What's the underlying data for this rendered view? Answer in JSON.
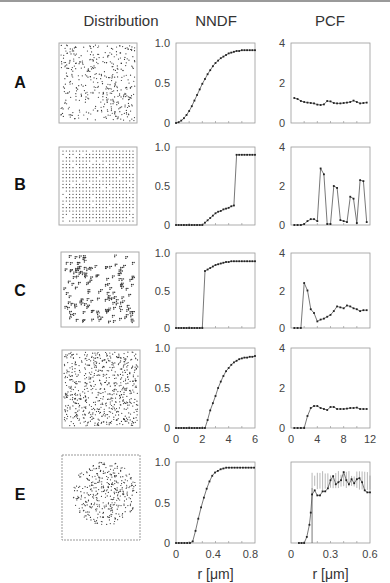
{
  "headers": {
    "distribution": "Distribution",
    "nndf": "NNDF",
    "pcf": "PCF"
  },
  "row_labels": [
    "A",
    "B",
    "C",
    "D",
    "E"
  ],
  "x_axis_label": "r [μm]",
  "colors": {
    "frame": "#9a9a9a",
    "series": "#333333",
    "marker": "#222222",
    "errorbar": "#888888"
  },
  "chart_data": [
    {
      "type": "line",
      "panel": "A-NNDF",
      "title": "NNDF",
      "xlim": [
        0,
        6
      ],
      "ylim": [
        0,
        1.0
      ],
      "yticks": [
        "0",
        "0.5",
        "1.0"
      ],
      "xticks": [],
      "x": [
        0,
        0.2,
        0.4,
        0.6,
        0.8,
        1.0,
        1.2,
        1.4,
        1.6,
        1.8,
        2.0,
        2.2,
        2.4,
        2.6,
        2.8,
        3.0,
        3.2,
        3.4,
        3.6,
        3.8,
        4.0,
        4.2,
        4.4,
        4.6,
        4.8,
        5.0,
        5.2,
        5.4,
        5.6,
        5.8,
        6.0
      ],
      "y": [
        0,
        0.01,
        0.03,
        0.06,
        0.1,
        0.15,
        0.21,
        0.28,
        0.35,
        0.42,
        0.49,
        0.55,
        0.61,
        0.66,
        0.71,
        0.75,
        0.78,
        0.81,
        0.83,
        0.85,
        0.87,
        0.88,
        0.89,
        0.9,
        0.9,
        0.91,
        0.91,
        0.91,
        0.91,
        0.91,
        0.91
      ]
    },
    {
      "type": "line",
      "panel": "A-PCF",
      "title": "PCF",
      "xlim": [
        0,
        12
      ],
      "ylim": [
        0,
        4
      ],
      "yticks": [
        "0",
        "2",
        "4"
      ],
      "xticks": [],
      "x": [
        0.5,
        1,
        1.5,
        2,
        2.5,
        3,
        3.5,
        4,
        4.5,
        5,
        5.5,
        6,
        6.5,
        7,
        7.5,
        8,
        8.5,
        9,
        9.5,
        10,
        10.5,
        11,
        11.5
      ],
      "y": [
        1.25,
        1.2,
        1.1,
        1.05,
        1.02,
        1.0,
        0.98,
        0.92,
        0.9,
        0.93,
        1.1,
        1.08,
        1.0,
        0.98,
        0.98,
        1.0,
        1.02,
        1.05,
        1.12,
        1.05,
        0.98,
        1.0,
        1.02
      ]
    },
    {
      "type": "line",
      "panel": "B-NNDF",
      "xlim": [
        0,
        6
      ],
      "ylim": [
        0,
        1.0
      ],
      "yticks": [
        "0",
        "0.5",
        "1.0"
      ],
      "xticks": [],
      "x": [
        0,
        0.2,
        0.4,
        0.6,
        0.8,
        1.0,
        1.2,
        1.4,
        1.6,
        1.8,
        2.0,
        2.2,
        2.4,
        2.6,
        2.8,
        3.0,
        3.2,
        3.4,
        3.6,
        3.8,
        4.0,
        4.2,
        4.4,
        4.6,
        4.8,
        5.0,
        5.2,
        5.4,
        5.6,
        5.8,
        6.0
      ],
      "y": [
        0,
        0,
        0,
        0,
        0,
        0,
        0,
        0,
        0,
        0,
        0,
        0.03,
        0.06,
        0.09,
        0.12,
        0.15,
        0.17,
        0.18,
        0.2,
        0.21,
        0.22,
        0.24,
        0.25,
        0.9,
        0.9,
        0.9,
        0.9,
        0.9,
        0.9,
        0.9,
        0.9
      ]
    },
    {
      "type": "line",
      "panel": "B-PCF",
      "xlim": [
        0,
        12
      ],
      "ylim": [
        0,
        4
      ],
      "yticks": [
        "0",
        "2",
        "4"
      ],
      "xticks": [],
      "x": [
        0.5,
        1,
        1.5,
        2,
        2.5,
        3,
        3.5,
        4,
        4.5,
        5,
        5.5,
        6,
        6.5,
        7,
        7.5,
        8,
        8.5,
        9,
        9.5,
        10,
        10.5,
        11,
        11.5
      ],
      "y": [
        0,
        0,
        0,
        0.05,
        0.2,
        0.3,
        0.3,
        0.2,
        2.9,
        2.6,
        0.05,
        0.05,
        2.0,
        1.9,
        0.25,
        0.2,
        0.15,
        1.45,
        1.35,
        0.1,
        2.3,
        2.25,
        0.15
      ]
    },
    {
      "type": "line",
      "panel": "C-NNDF",
      "xlim": [
        0,
        6
      ],
      "ylim": [
        0,
        1.0
      ],
      "yticks": [
        "0",
        "0.5",
        "1.0"
      ],
      "xticks": [],
      "x": [
        0,
        0.2,
        0.4,
        0.6,
        0.8,
        1.0,
        1.2,
        1.4,
        1.6,
        1.8,
        2.0,
        2.2,
        2.4,
        2.6,
        2.8,
        3.0,
        3.2,
        3.4,
        3.6,
        3.8,
        4.0,
        4.2,
        4.4,
        4.6,
        4.8,
        5.0,
        5.2,
        5.4,
        5.6,
        5.8,
        6.0
      ],
      "y": [
        0,
        0,
        0,
        0,
        0,
        0,
        0,
        0,
        0,
        0,
        0,
        0.76,
        0.78,
        0.8,
        0.82,
        0.84,
        0.85,
        0.86,
        0.87,
        0.88,
        0.88,
        0.89,
        0.89,
        0.89,
        0.89,
        0.89,
        0.89,
        0.89,
        0.89,
        0.89,
        0.89
      ]
    },
    {
      "type": "line",
      "panel": "C-PCF",
      "xlim": [
        0,
        12
      ],
      "ylim": [
        0,
        4
      ],
      "yticks": [
        "0",
        "2",
        "4"
      ],
      "xticks": [],
      "x": [
        0.5,
        1,
        1.5,
        2,
        2.5,
        3,
        3.5,
        4,
        4.5,
        5,
        5.5,
        6,
        6.5,
        7,
        7.5,
        8,
        8.5,
        9,
        9.5,
        10,
        10.5,
        11,
        11.5
      ],
      "y": [
        0,
        0,
        0,
        2.4,
        2.0,
        1.0,
        0.8,
        0.35,
        0.45,
        0.5,
        0.6,
        0.7,
        0.9,
        1.15,
        1.1,
        1.05,
        1.2,
        1.15,
        1.05,
        1.0,
        0.9,
        0.95,
        0.95
      ]
    },
    {
      "type": "line",
      "panel": "D-NNDF",
      "xlim": [
        0,
        6
      ],
      "ylim": [
        0,
        1.0
      ],
      "yticks": [
        "0",
        "0.5",
        "1.0"
      ],
      "xticks": [
        "0",
        "2",
        "4",
        "6"
      ],
      "x": [
        0,
        0.2,
        0.4,
        0.6,
        0.8,
        1.0,
        1.2,
        1.4,
        1.6,
        1.8,
        2.0,
        2.2,
        2.4,
        2.6,
        2.8,
        3.0,
        3.2,
        3.4,
        3.6,
        3.8,
        4.0,
        4.2,
        4.4,
        4.6,
        4.8,
        5.0,
        5.2,
        5.4,
        5.6,
        5.8,
        6.0
      ],
      "y": [
        0,
        0,
        0,
        0,
        0,
        0,
        0,
        0,
        0,
        0,
        0,
        0,
        0.1,
        0.22,
        0.31,
        0.4,
        0.5,
        0.58,
        0.65,
        0.71,
        0.75,
        0.79,
        0.82,
        0.84,
        0.86,
        0.87,
        0.88,
        0.88,
        0.89,
        0.89,
        0.9
      ]
    },
    {
      "type": "line",
      "panel": "D-PCF",
      "xlim": [
        0,
        12
      ],
      "ylim": [
        0,
        4
      ],
      "yticks": [
        "0",
        "2",
        "4"
      ],
      "xticks": [
        "0",
        "4",
        "8",
        "12"
      ],
      "x": [
        0.5,
        1,
        1.5,
        2,
        2.5,
        3,
        3.5,
        4,
        4.5,
        5,
        5.5,
        6,
        6.5,
        7,
        7.5,
        8,
        8.5,
        9,
        9.5,
        10,
        10.5,
        11,
        11.5
      ],
      "y": [
        0,
        0,
        0,
        0,
        0.6,
        1.0,
        1.1,
        1.1,
        1.0,
        0.95,
        0.9,
        1.05,
        1.05,
        0.95,
        0.95,
        0.95,
        0.97,
        1.0,
        1.0,
        1.02,
        0.95,
        0.95,
        0.95
      ]
    },
    {
      "type": "line",
      "panel": "E-NNDF",
      "xlim": [
        0,
        0.85
      ],
      "ylim": [
        0,
        1.0
      ],
      "yticks": [
        "0",
        "0.5",
        "1.0"
      ],
      "xticks": [
        "0",
        "0.4",
        "0.8"
      ],
      "xlabel": "r [μm]",
      "x": [
        0,
        0.03,
        0.06,
        0.09,
        0.12,
        0.15,
        0.18,
        0.21,
        0.24,
        0.27,
        0.3,
        0.33,
        0.36,
        0.39,
        0.42,
        0.45,
        0.48,
        0.51,
        0.54,
        0.57,
        0.6,
        0.63,
        0.66,
        0.69,
        0.72,
        0.75,
        0.78,
        0.81,
        0.84
      ],
      "y": [
        0,
        0,
        0,
        0,
        0,
        0,
        0.02,
        0.15,
        0.3,
        0.44,
        0.56,
        0.67,
        0.76,
        0.83,
        0.87,
        0.89,
        0.91,
        0.92,
        0.93,
        0.93,
        0.93,
        0.93,
        0.93,
        0.93,
        0.93,
        0.93,
        0.93,
        0.93,
        0.93
      ]
    },
    {
      "type": "line",
      "panel": "E-PCF",
      "xlim": [
        0,
        0.6
      ],
      "ylim": [
        0,
        4
      ],
      "yticks": [],
      "xticks": [
        "0",
        "0.3",
        "0.6"
      ],
      "xlabel": "r [μm]",
      "x": [
        0.06,
        0.08,
        0.1,
        0.12,
        0.14,
        0.15,
        0.16,
        0.18,
        0.2,
        0.22,
        0.24,
        0.26,
        0.28,
        0.3,
        0.32,
        0.34,
        0.36,
        0.38,
        0.4,
        0.42,
        0.44,
        0.46,
        0.48,
        0.5,
        0.52,
        0.54,
        0.56,
        0.58,
        0.6
      ],
      "y": [
        0,
        0,
        0,
        0.3,
        0.9,
        1.5,
        2.4,
        2.6,
        2.35,
        2.35,
        2.55,
        2.55,
        2.7,
        3.1,
        3.3,
        2.9,
        3.0,
        3.1,
        3.5,
        3.1,
        2.9,
        3.15,
        2.95,
        3.15,
        3.2,
        3.0,
        2.6,
        2.5,
        2.5
      ],
      "errorbar_band": {
        "x_start": 0.16,
        "x_end": 0.6,
        "lower": 2.7,
        "upper": 3.4
      }
    }
  ]
}
